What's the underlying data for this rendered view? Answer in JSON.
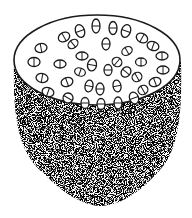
{
  "illustration": {
    "subject": "stippled cylindrical structure with oval pores on top surface",
    "colors": {
      "background": "#ffffff",
      "ink": "#1a1a1a",
      "stipple_light": "#9a9a9a"
    },
    "top_surface": {
      "ellipse": {
        "cx": 97,
        "cy": 60,
        "rx": 83,
        "ry": 45
      },
      "pore_count": 40
    },
    "body": {
      "texture": "stipple",
      "bottom_y": 205
    }
  }
}
